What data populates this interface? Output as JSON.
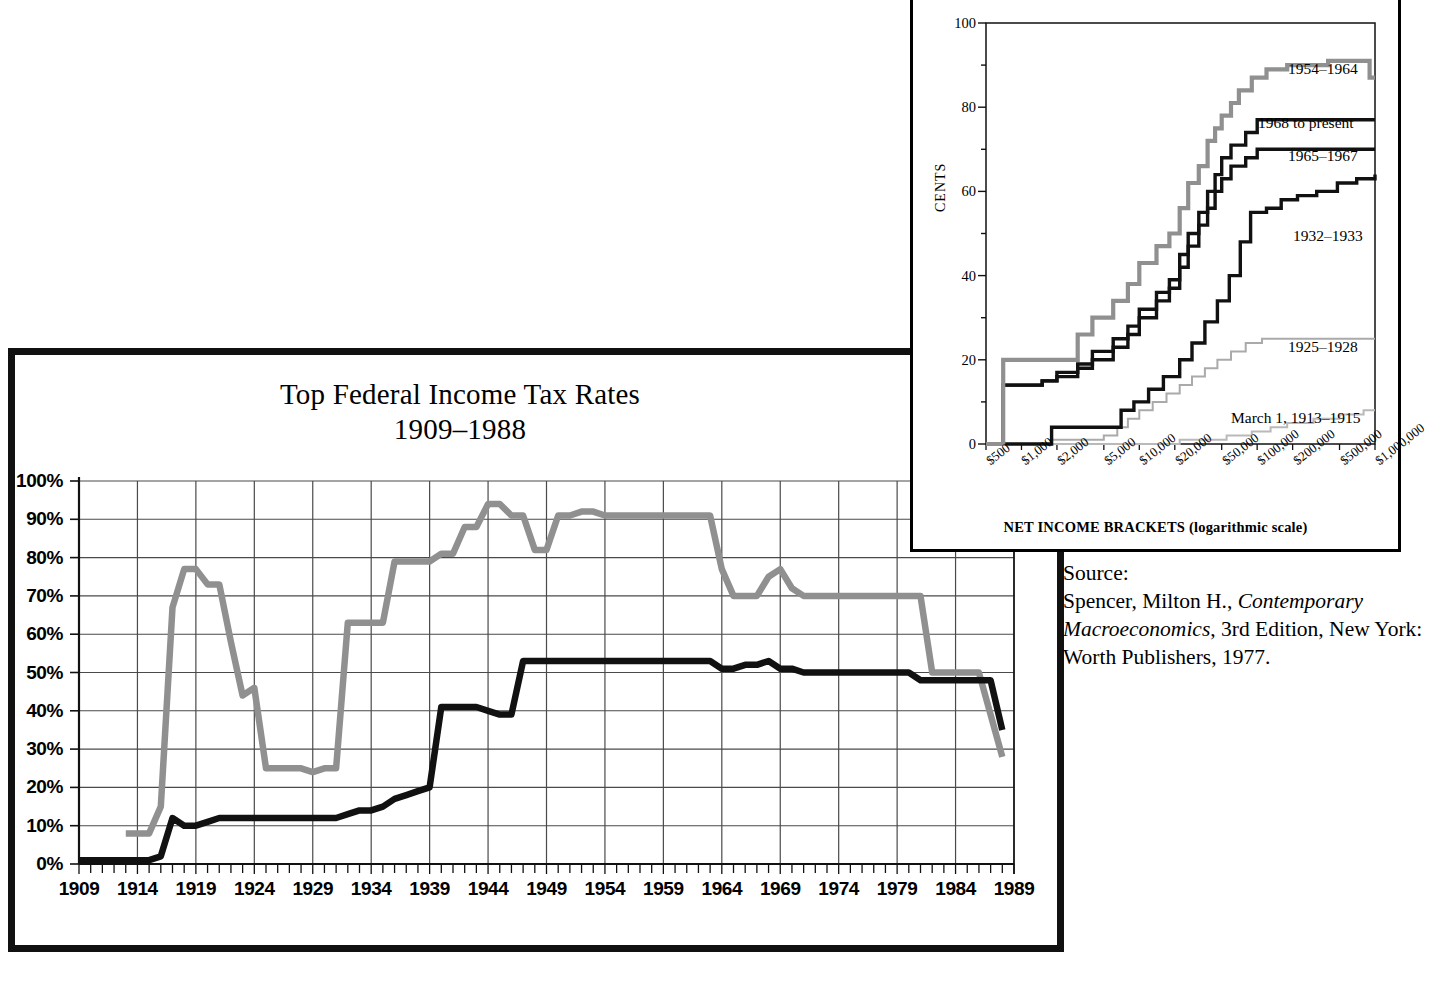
{
  "main": {
    "title_line1": "Top Federal Income Tax Rates",
    "title_line2": "1909–1988",
    "y_ticks": [
      "0%",
      "10%",
      "20%",
      "30%",
      "40%",
      "50%",
      "60%",
      "70%",
      "80%",
      "90%",
      "100%"
    ],
    "x_ticks": [
      "1909",
      "1914",
      "1919",
      "1924",
      "1929",
      "1934",
      "1939",
      "1944",
      "1949",
      "1954",
      "1959",
      "1964",
      "1969",
      "1974",
      "1979",
      "1984",
      "1989"
    ]
  },
  "inset": {
    "y_axis_label": "CENTS",
    "x_axis_label": "NET INCOME BRACKETS (logarithmic scale)",
    "y_ticks": [
      "0",
      "20",
      "40",
      "60",
      "80",
      "100"
    ],
    "x_ticks": [
      "$500",
      "$1,000",
      "$2,000",
      "$5,000",
      "$10,000",
      "$20,000",
      "$50,000",
      "$100,000",
      "$200,000",
      "$500,000",
      "$1,000,000"
    ],
    "legend": [
      {
        "label": "1954–1964",
        "x": 1285,
        "y": 57
      },
      {
        "label": "1968 to present",
        "x": 1255,
        "y": 111
      },
      {
        "label": "1965–1967",
        "x": 1285,
        "y": 144
      },
      {
        "label": "1932–1933",
        "x": 1290,
        "y": 224
      },
      {
        "label": "1925–1928",
        "x": 1285,
        "y": 335
      },
      {
        "label": "March 1, 1913–1915",
        "x": 1228,
        "y": 406
      }
    ]
  },
  "source": {
    "label": "Source:",
    "line1_pre": "Spencer, Milton H., ",
    "line1_italic": "Contemporary",
    "line2_italic": "Macroeconomics",
    "line2_post": ", 3rd Edition, New",
    "line3": "York: Worth Publishers, 1977."
  },
  "colors": {
    "black_series": "#111111",
    "gray_series": "#909090",
    "grid": "#4a4a4a",
    "border": "#111111"
  },
  "chart_data": [
    {
      "type": "line",
      "title": "Top Federal Income Tax Rates 1909–1988",
      "xlabel": "",
      "ylabel": "",
      "xlim": [
        1909,
        1989
      ],
      "ylim": [
        0,
        100
      ],
      "grid": true,
      "legend_position": "none",
      "x": [
        1909,
        1910,
        1911,
        1912,
        1913,
        1914,
        1915,
        1916,
        1917,
        1918,
        1919,
        1920,
        1921,
        1922,
        1923,
        1924,
        1925,
        1926,
        1927,
        1928,
        1929,
        1930,
        1931,
        1932,
        1933,
        1934,
        1935,
        1936,
        1937,
        1938,
        1939,
        1940,
        1941,
        1942,
        1943,
        1944,
        1945,
        1946,
        1947,
        1948,
        1949,
        1950,
        1951,
        1952,
        1953,
        1954,
        1955,
        1956,
        1957,
        1958,
        1959,
        1960,
        1961,
        1962,
        1963,
        1964,
        1965,
        1966,
        1967,
        1968,
        1969,
        1970,
        1971,
        1972,
        1973,
        1974,
        1975,
        1976,
        1977,
        1978,
        1979,
        1980,
        1981,
        1982,
        1983,
        1984,
        1985,
        1986,
        1987,
        1988
      ],
      "series": [
        {
          "name": "Top marginal rate (highest bracket)",
          "color": "#909090",
          "values": [
            null,
            null,
            null,
            null,
            8,
            8,
            8,
            15,
            67,
            77,
            77,
            73,
            73,
            58,
            44,
            46,
            25,
            25,
            25,
            25,
            24,
            25,
            25,
            63,
            63,
            63,
            63,
            79,
            79,
            79,
            79,
            81,
            81,
            88,
            88,
            94,
            94,
            91,
            91,
            82,
            82,
            91,
            91,
            92,
            92,
            91,
            91,
            91,
            91,
            91,
            91,
            91,
            91,
            91,
            91,
            77,
            70,
            70,
            70,
            75,
            77,
            72,
            70,
            70,
            70,
            70,
            70,
            70,
            70,
            70,
            70,
            70,
            70,
            50,
            50,
            50,
            50,
            50,
            39,
            28
          ]
        },
        {
          "name": "Effective / lower top rate series",
          "color": "#111111",
          "values": [
            1,
            1,
            1,
            1,
            1,
            1,
            1,
            2,
            12,
            10,
            10,
            11,
            12,
            12,
            12,
            12,
            12,
            12,
            12,
            12,
            12,
            12,
            12,
            13,
            14,
            14,
            15,
            17,
            18,
            19,
            20,
            41,
            41,
            41,
            41,
            40,
            39,
            39,
            53,
            53,
            53,
            53,
            53,
            53,
            53,
            53,
            53,
            53,
            53,
            53,
            53,
            53,
            53,
            53,
            53,
            51,
            51,
            52,
            52,
            53,
            51,
            51,
            50,
            50,
            50,
            50,
            50,
            50,
            50,
            50,
            50,
            50,
            48,
            48,
            48,
            48,
            48,
            48,
            48,
            35
          ]
        }
      ]
    },
    {
      "type": "line",
      "subtype": "step",
      "title": "Progressive tax rate schedules by net income bracket",
      "xlabel": "NET INCOME BRACKETS (logarithmic scale)",
      "ylabel": "CENTS",
      "xscale": "log",
      "xlim": [
        500,
        1000000
      ],
      "ylim": [
        0,
        100
      ],
      "grid": false,
      "legend_position": "inline-right",
      "x_ticks": [
        500,
        1000,
        2000,
        5000,
        10000,
        20000,
        50000,
        100000,
        200000,
        500000,
        1000000
      ],
      "series": [
        {
          "name": "1954–1964",
          "color": "#909090",
          "points": [
            [
              500,
              0
            ],
            [
              700,
              20
            ],
            [
              2000,
              20
            ],
            [
              3000,
              26
            ],
            [
              4000,
              30
            ],
            [
              6000,
              34
            ],
            [
              8000,
              38
            ],
            [
              10000,
              43
            ],
            [
              14000,
              47
            ],
            [
              18000,
              50
            ],
            [
              22000,
              56
            ],
            [
              26000,
              62
            ],
            [
              32000,
              66
            ],
            [
              38000,
              72
            ],
            [
              44000,
              75
            ],
            [
              50000,
              78
            ],
            [
              60000,
              81
            ],
            [
              70000,
              84
            ],
            [
              90000,
              87
            ],
            [
              120000,
              89
            ],
            [
              180000,
              90
            ],
            [
              400000,
              91
            ],
            [
              700000,
              91
            ],
            [
              900000,
              87
            ],
            [
              1000000,
              87
            ]
          ]
        },
        {
          "name": "1968 to present",
          "color": "#111111",
          "points": [
            [
              500,
              0
            ],
            [
              700,
              14
            ],
            [
              1500,
              15
            ],
            [
              2000,
              17
            ],
            [
              3000,
              19
            ],
            [
              4000,
              22
            ],
            [
              6000,
              25
            ],
            [
              8000,
              28
            ],
            [
              10000,
              32
            ],
            [
              14000,
              36
            ],
            [
              18000,
              39
            ],
            [
              22000,
              45
            ],
            [
              26000,
              50
            ],
            [
              32000,
              55
            ],
            [
              38000,
              60
            ],
            [
              44000,
              64
            ],
            [
              50000,
              68
            ],
            [
              60000,
              71
            ],
            [
              80000,
              74
            ],
            [
              100000,
              77
            ],
            [
              1000000,
              77
            ]
          ]
        },
        {
          "name": "1965–1967",
          "color": "#111111",
          "points": [
            [
              500,
              0
            ],
            [
              700,
              14
            ],
            [
              1500,
              15
            ],
            [
              2000,
              16
            ],
            [
              3000,
              18
            ],
            [
              4000,
              20
            ],
            [
              6000,
              23
            ],
            [
              8000,
              26
            ],
            [
              10000,
              30
            ],
            [
              14000,
              34
            ],
            [
              18000,
              37
            ],
            [
              22000,
              42
            ],
            [
              26000,
              47
            ],
            [
              32000,
              52
            ],
            [
              38000,
              56
            ],
            [
              44000,
              60
            ],
            [
              50000,
              63
            ],
            [
              60000,
              66
            ],
            [
              80000,
              68
            ],
            [
              100000,
              70
            ],
            [
              1000000,
              70
            ]
          ]
        },
        {
          "name": "1932–1933",
          "color": "#111111",
          "points": [
            [
              500,
              0
            ],
            [
              1700,
              0
            ],
            [
              1800,
              4
            ],
            [
              6000,
              4
            ],
            [
              7000,
              8
            ],
            [
              9000,
              10
            ],
            [
              12000,
              13
            ],
            [
              16000,
              16
            ],
            [
              22000,
              20
            ],
            [
              28000,
              24
            ],
            [
              36000,
              29
            ],
            [
              46000,
              34
            ],
            [
              58000,
              40
            ],
            [
              72000,
              48
            ],
            [
              88000,
              55
            ],
            [
              120000,
              56
            ],
            [
              160000,
              58
            ],
            [
              220000,
              59
            ],
            [
              320000,
              60
            ],
            [
              480000,
              62
            ],
            [
              700000,
              63
            ],
            [
              1000000,
              64
            ]
          ]
        },
        {
          "name": "1925–1928",
          "color": "#aaaaaa",
          "points": [
            [
              500,
              0
            ],
            [
              1800,
              1
            ],
            [
              4000,
              1
            ],
            [
              5000,
              2
            ],
            [
              6500,
              4
            ],
            [
              8000,
              6
            ],
            [
              10000,
              8
            ],
            [
              13000,
              10
            ],
            [
              17000,
              12
            ],
            [
              22000,
              14
            ],
            [
              28000,
              16
            ],
            [
              36000,
              18
            ],
            [
              46000,
              20
            ],
            [
              60000,
              22
            ],
            [
              80000,
              24
            ],
            [
              110000,
              25
            ],
            [
              160000,
              25
            ],
            [
              1000000,
              25
            ]
          ]
        },
        {
          "name": "March 1, 1913–1915",
          "color": "#b9b9b9",
          "points": [
            [
              500,
              0
            ],
            [
              20000,
              0
            ],
            [
              22000,
              1
            ],
            [
              50000,
              1
            ],
            [
              55000,
              2
            ],
            [
              80000,
              2
            ],
            [
              90000,
              3
            ],
            [
              130000,
              4
            ],
            [
              180000,
              5
            ],
            [
              260000,
              5
            ],
            [
              300000,
              6
            ],
            [
              450000,
              6
            ],
            [
              500000,
              7
            ],
            [
              750000,
              7
            ],
            [
              800000,
              8
            ],
            [
              1000000,
              8
            ]
          ]
        }
      ]
    }
  ]
}
